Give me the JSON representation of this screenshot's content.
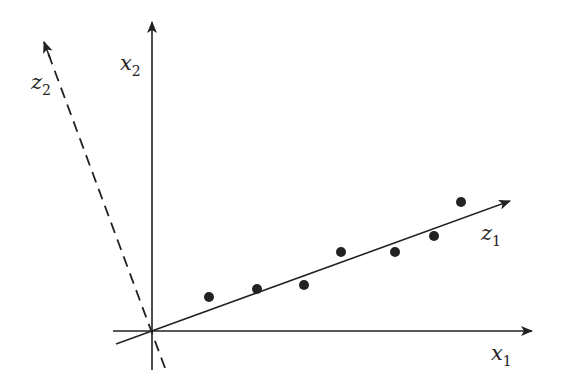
{
  "labels": {
    "x1": {
      "main": "x",
      "sub": "1"
    },
    "x2": {
      "main": "x",
      "sub": "2"
    },
    "z1": {
      "main": "z",
      "sub": "1"
    },
    "z2": {
      "main": "z",
      "sub": "2"
    }
  },
  "points": [
    [
      209,
      297
    ],
    [
      257,
      289
    ],
    [
      304,
      285
    ],
    [
      341,
      252
    ],
    [
      395,
      252
    ],
    [
      434,
      236
    ],
    [
      461,
      202
    ]
  ],
  "colors": {
    "ink": "#222222"
  }
}
